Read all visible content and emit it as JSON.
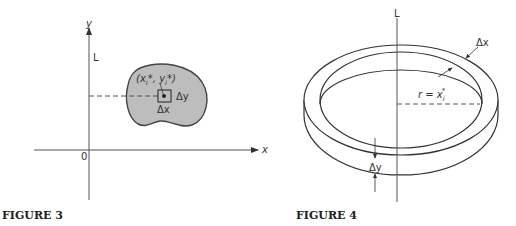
{
  "figure3": {
    "caption": "FIGURE 3",
    "axis_y_label": "y",
    "axis_x_label": "x",
    "origin_label": "0",
    "line_label": "L",
    "point_label_x": "(x",
    "point_label_i1": "i",
    "point_label_mid": "*, y",
    "point_label_i2": "i",
    "point_label_end": "*)",
    "dy_label": "Δy",
    "dx_label": "Δx",
    "region_fill": "#bdbdbd"
  },
  "figure4": {
    "caption": "FIGURE 4",
    "line_label": "L",
    "dx_label": "Δx",
    "dy_label": "Δy",
    "radius_label_r": "r = x",
    "radius_label_sub": "i",
    "radius_label_sup": "*"
  }
}
